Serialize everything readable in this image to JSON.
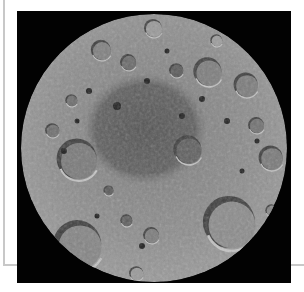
{
  "image": {
    "subject": "Lunar south pole mosaic",
    "background_color": "#020202",
    "frame_color": "#c8c8c8",
    "disc": {
      "cx": 137,
      "cy": 137,
      "rx": 133,
      "ry": 134,
      "base_color": "#8a8a8a"
    },
    "basin": {
      "cx": 128,
      "cy": 118,
      "rx": 62,
      "ry": 56,
      "color": "#5e5e5e"
    },
    "craters": [
      {
        "x": 62,
        "y": 150,
        "r": 20,
        "fill": "#7a7a7a"
      },
      {
        "x": 63,
        "y": 236,
        "r": 24,
        "fill": "#858585"
      },
      {
        "x": 215,
        "y": 214,
        "r": 26,
        "fill": "#8c8c8c"
      },
      {
        "x": 192,
        "y": 62,
        "r": 14,
        "fill": "#7e7e7e"
      },
      {
        "x": 230,
        "y": 75,
        "r": 12,
        "fill": "#7c7c7c"
      },
      {
        "x": 137,
        "y": 18,
        "r": 9,
        "fill": "#9a9a9a"
      },
      {
        "x": 85,
        "y": 40,
        "r": 10,
        "fill": "#808080"
      },
      {
        "x": 112,
        "y": 52,
        "r": 8,
        "fill": "#6a6a6a"
      },
      {
        "x": 255,
        "y": 148,
        "r": 12,
        "fill": "#7a7a7a"
      },
      {
        "x": 36,
        "y": 120,
        "r": 7,
        "fill": "#6e6e6e"
      },
      {
        "x": 160,
        "y": 60,
        "r": 7,
        "fill": "#5a5a5a"
      },
      {
        "x": 172,
        "y": 140,
        "r": 14,
        "fill": "#606060"
      },
      {
        "x": 110,
        "y": 210,
        "r": 6,
        "fill": "#5c5c5c"
      },
      {
        "x": 135,
        "y": 225,
        "r": 8,
        "fill": "#7c7c7c"
      },
      {
        "x": 240,
        "y": 115,
        "r": 8,
        "fill": "#727272"
      },
      {
        "x": 55,
        "y": 90,
        "r": 6,
        "fill": "#6c6c6c"
      },
      {
        "x": 120,
        "y": 263,
        "r": 7,
        "fill": "#9a9a9a"
      },
      {
        "x": 200,
        "y": 30,
        "r": 6,
        "fill": "#9c9c9c"
      },
      {
        "x": 92,
        "y": 180,
        "r": 5,
        "fill": "#5a5a5a"
      },
      {
        "x": 255,
        "y": 200,
        "r": 6,
        "fill": "#858585"
      }
    ],
    "dark_pits": [
      {
        "x": 47,
        "y": 140,
        "r": 3
      },
      {
        "x": 72,
        "y": 80,
        "r": 3
      },
      {
        "x": 130,
        "y": 70,
        "r": 3
      },
      {
        "x": 185,
        "y": 88,
        "r": 3
      },
      {
        "x": 240,
        "y": 130,
        "r": 2.5
      },
      {
        "x": 150,
        "y": 40,
        "r": 2.5
      },
      {
        "x": 100,
        "y": 95,
        "r": 4
      },
      {
        "x": 210,
        "y": 110,
        "r": 3
      },
      {
        "x": 125,
        "y": 235,
        "r": 3
      },
      {
        "x": 60,
        "y": 110,
        "r": 2.5
      },
      {
        "x": 165,
        "y": 105,
        "r": 3
      },
      {
        "x": 225,
        "y": 160,
        "r": 2.5
      },
      {
        "x": 80,
        "y": 205,
        "r": 2.5
      }
    ]
  }
}
